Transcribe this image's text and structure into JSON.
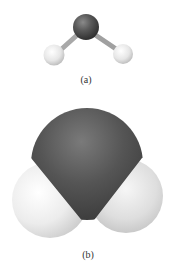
{
  "figure": {
    "panels": [
      {
        "id": "a",
        "label": "(a)",
        "model": "ball-and-stick"
      },
      {
        "id": "b",
        "label": "(b)",
        "model": "space-filling"
      }
    ],
    "atoms": {
      "oxygen": {
        "color": "#4a4a4a"
      },
      "hydrogen": {
        "color": "#e8e8e8"
      }
    }
  }
}
